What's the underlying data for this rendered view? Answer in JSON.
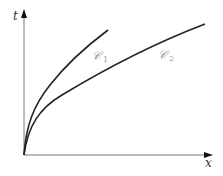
{
  "diagram": {
    "axes": {
      "y_label": "t",
      "x_label": "x"
    },
    "curves": [
      {
        "name": "C1",
        "label": "𝒞",
        "subscript": "1"
      },
      {
        "name": "C2",
        "label": "𝒞",
        "subscript": "2"
      }
    ],
    "colors": {
      "axis": "#777777",
      "curve": "#222222",
      "curve_label": "#9a9a9a"
    }
  }
}
